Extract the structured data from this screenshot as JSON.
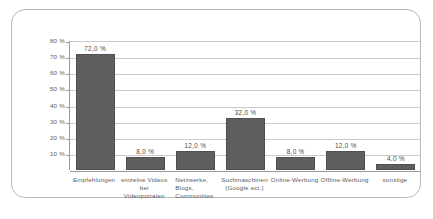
{
  "chart_data": {
    "type": "bar",
    "title": "",
    "subtitle": "",
    "xlabel": "",
    "ylabel": "",
    "ylim": [
      0,
      80
    ],
    "grid": true,
    "legend": false,
    "value_suffix": " %",
    "decimal_separator": ",",
    "categories": [
      "Empfehlungen",
      "einzelne Videos\nbei Videoportalen",
      "Netzwerke,\nBlogs,\nCommunities",
      "Suchmaschinen\n(Google ect.)",
      "Online-Werbung",
      "Offline-Werbung",
      "sonstige"
    ],
    "category_lines": [
      [
        "Empfehlungen"
      ],
      [
        "einzelne Videos",
        "bei Videoportalen"
      ],
      [
        "Netzwerke,",
        "Blogs,",
        "Communities"
      ],
      [
        "Suchmaschinen",
        "(Google ect.)"
      ],
      [
        "Online-Werbung"
      ],
      [
        "Offline-Werbung"
      ],
      [
        "sonstige"
      ]
    ],
    "values": [
      72.0,
      8.0,
      12.0,
      32.0,
      8.0,
      12.0,
      4.0
    ],
    "data_labels": [
      "72,0 %",
      "8,0 %",
      "12,0 %",
      "32,0 %",
      "8,0 %",
      "12,0 %",
      "4,0 %"
    ],
    "y_ticks": [
      10,
      20,
      30,
      40,
      50,
      60,
      70,
      80
    ],
    "y_tick_labels": [
      "10 %",
      "20 %",
      "30 %",
      "40 %",
      "50 %",
      "60 %",
      "70 %",
      "80 %"
    ],
    "colors": {
      "bar_fill": "#5f5f5f",
      "bar_stroke": "#4f4f4f",
      "gridline": "#c9c9c9",
      "axis": "#9a9a9a",
      "frame": "#b9b9b9",
      "text": "#5b5b5b",
      "label_text": "#4a4a4a",
      "background": "#ffffff"
    }
  }
}
